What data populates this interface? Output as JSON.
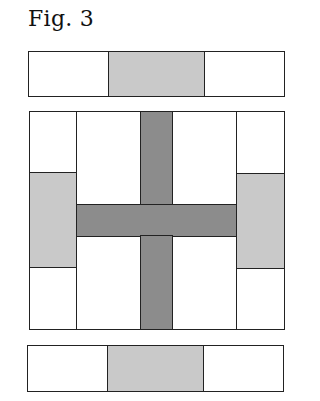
{
  "figure": {
    "title": "Fig. 3",
    "colors": {
      "outline": "#222222",
      "white": "#ffffff",
      "light_gray": "#c9c9c9",
      "dark_gray": "#8c8c8c"
    },
    "top_strip": [
      "white",
      "light_gray",
      "white"
    ],
    "center_block": {
      "left_column": [
        "white",
        "light_gray",
        "white"
      ],
      "right_column": [
        "white",
        "light_gray",
        "white"
      ],
      "middle": {
        "quadrants": [
          "white",
          "white",
          "white",
          "white"
        ],
        "cross_color": "dark_gray"
      }
    },
    "bottom_strip": [
      "white",
      "light_gray",
      "white"
    ]
  }
}
